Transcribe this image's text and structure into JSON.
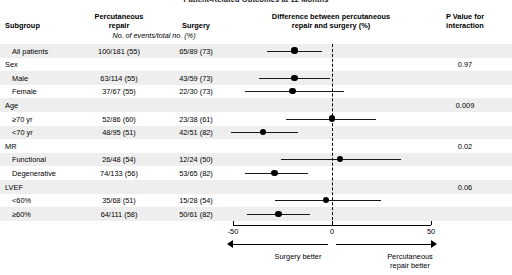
{
  "figure": {
    "title": "Patient-Related Outcomes at 12 Months",
    "columns": {
      "subgroup": "Subgroup",
      "percutaneous_repair": "Percutaneous\nrepair",
      "percutaneous_repair_l1": "Percutaneous",
      "percutaneous_repair_l2": "repair",
      "surgery": "Surgery",
      "events_note": "No. of events/total no. (%)",
      "difference_l1": "Difference between percutaneous",
      "difference_l2": "repair and surgery (%)",
      "pvalue_l1": "P Value for",
      "pvalue_l2": "interaction"
    },
    "axis": {
      "ticks": [
        "-50",
        "0",
        "50"
      ],
      "tick_values": [
        -50,
        0,
        50
      ],
      "min": -50,
      "max": 50,
      "left_label": "Surgery better",
      "right_label": "Percutaneous\nrepair better",
      "right_label_l1": "Percutaneous",
      "right_label_l2": "repair better",
      "zero_reference": 0
    }
  },
  "chart_data": {
    "type": "forest",
    "title": "Difference between percutaneous repair and surgery (%)",
    "xlabel": "Difference between percutaneous repair and surgery (%)",
    "xlim": [
      -50,
      50
    ],
    "reference_line": 0,
    "grid": false,
    "rows": [
      {
        "label": "All patients",
        "level": "item",
        "percutaneous_repair": "100/181 (55)",
        "surgery": "65/89 (73)",
        "estimate": -19,
        "ci_low": -33,
        "ci_high": -5,
        "p_value": ""
      },
      {
        "label": "Sex",
        "level": "header",
        "percutaneous_repair": "",
        "surgery": "",
        "estimate": null,
        "ci_low": null,
        "ci_high": null,
        "p_value": "0.97"
      },
      {
        "label": "Male",
        "level": "item",
        "percutaneous_repair": "63/114 (55)",
        "surgery": "43/59 (73)",
        "estimate": -19,
        "ci_low": -37,
        "ci_high": -1,
        "p_value": ""
      },
      {
        "label": "Female",
        "level": "item",
        "percutaneous_repair": "37/67 (55)",
        "surgery": "22/30 (73)",
        "estimate": -20,
        "ci_low": -44,
        "ci_high": 6,
        "p_value": ""
      },
      {
        "label": "Age",
        "level": "header",
        "percutaneous_repair": "",
        "surgery": "",
        "estimate": null,
        "ci_low": null,
        "ci_high": null,
        "p_value": "0.009"
      },
      {
        "label": "≥70 yr",
        "level": "item",
        "percutaneous_repair": "52/86 (60)",
        "surgery": "23/38 (61)",
        "estimate": 0,
        "ci_low": -23,
        "ci_high": 22,
        "p_value": ""
      },
      {
        "label": "<70 yr",
        "level": "item",
        "percutaneous_repair": "48/95 (51)",
        "surgery": "42/51 (82)",
        "estimate": -35,
        "ci_low": -51,
        "ci_high": -17,
        "p_value": ""
      },
      {
        "label": "MR",
        "level": "header",
        "percutaneous_repair": "",
        "surgery": "",
        "estimate": null,
        "ci_low": null,
        "ci_high": null,
        "p_value": "0.02"
      },
      {
        "label": "Functional",
        "level": "item",
        "percutaneous_repair": "26/48 (54)",
        "surgery": "12/24 (50)",
        "estimate": 4,
        "ci_low": -26,
        "ci_high": 35,
        "p_value": ""
      },
      {
        "label": "Degenerative",
        "level": "item",
        "percutaneous_repair": "74/133 (56)",
        "surgery": "53/65 (82)",
        "estimate": -29,
        "ci_low": -44,
        "ci_high": -12,
        "p_value": ""
      },
      {
        "label": "LVEF",
        "level": "header",
        "percutaneous_repair": "",
        "surgery": "",
        "estimate": null,
        "ci_low": null,
        "ci_high": null,
        "p_value": "0.06"
      },
      {
        "label": "<60%",
        "level": "item",
        "percutaneous_repair": "35/68 (51)",
        "surgery": "15/28 (54)",
        "estimate": -3,
        "ci_low": -29,
        "ci_high": 25,
        "p_value": ""
      },
      {
        "label": "≥60%",
        "level": "item",
        "percutaneous_repair": "64/111 (58)",
        "surgery": "50/61 (82)",
        "estimate": -27,
        "ci_low": -43,
        "ci_high": -11,
        "p_value": ""
      }
    ]
  },
  "style": {
    "band_color": "#eeeeee",
    "marker_color": "#000000",
    "line_color": "#1a1a1a",
    "background": "#ffffff"
  }
}
